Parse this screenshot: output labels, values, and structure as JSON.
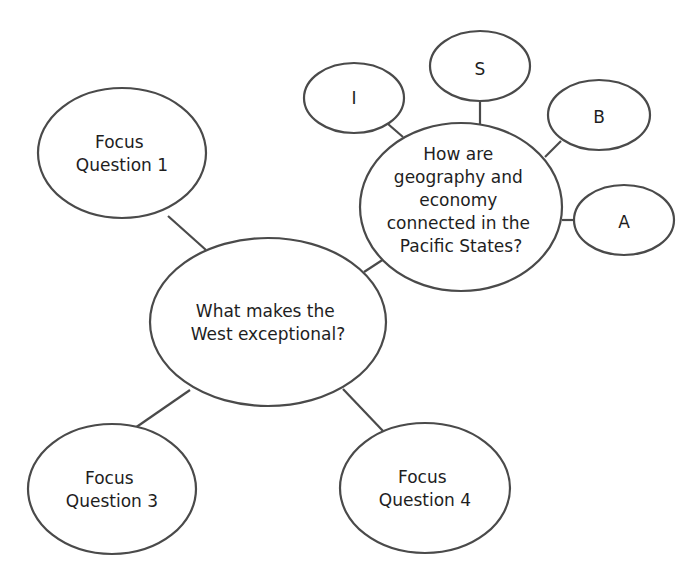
{
  "diagram": {
    "type": "web-organizer",
    "colors": {
      "stroke": "#4a4a4a",
      "text": "#1e1e1e",
      "background": "#ffffff"
    },
    "central": {
      "label_lines": [
        "What makes the",
        "West exceptional?"
      ]
    },
    "focus_questions": [
      {
        "id": "fq1",
        "label_lines": [
          "Focus",
          "Question 1"
        ]
      },
      {
        "id": "fq3",
        "label_lines": [
          "Focus",
          "Question 3"
        ]
      },
      {
        "id": "fq4",
        "label_lines": [
          "Focus",
          "Question 4"
        ]
      }
    ],
    "pacific": {
      "label_lines": [
        "How are",
        "geography and",
        "economy",
        "connected in the",
        "Pacific States?"
      ],
      "satellites": [
        {
          "id": "i",
          "label": "I"
        },
        {
          "id": "s",
          "label": "S"
        },
        {
          "id": "b",
          "label": "B"
        },
        {
          "id": "a",
          "label": "A"
        }
      ]
    }
  }
}
